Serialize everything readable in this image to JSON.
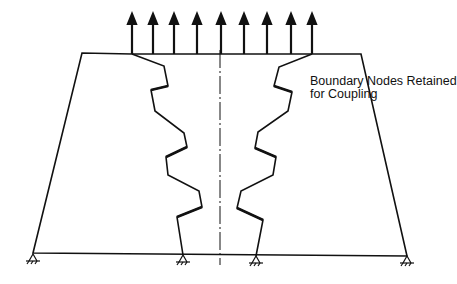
{
  "diagram": {
    "annotation": {
      "line1": "Boundary Nodes Retained",
      "line2": "for Coupling"
    },
    "arrows_x": [
      132,
      153,
      174,
      197,
      221,
      244,
      267,
      291,
      312
    ],
    "outline": {
      "top_left": [
        82,
        53
      ],
      "top_right": [
        361,
        54
      ],
      "bottom_left": [
        33,
        253
      ],
      "bottom_right": [
        407,
        256
      ]
    },
    "left_boundary": [
      [
        132,
        54
      ],
      [
        164,
        66
      ],
      [
        168,
        86
      ],
      [
        151,
        90
      ],
      [
        155,
        111
      ],
      [
        184,
        133
      ],
      [
        187,
        147
      ],
      [
        166,
        157
      ],
      [
        168,
        175
      ],
      [
        199,
        191
      ],
      [
        202,
        207
      ],
      [
        177,
        217
      ],
      [
        183,
        255
      ]
    ],
    "right_boundary": [
      [
        312,
        54
      ],
      [
        279,
        67
      ],
      [
        274,
        86
      ],
      [
        292,
        92
      ],
      [
        288,
        111
      ],
      [
        258,
        132
      ],
      [
        255,
        148
      ],
      [
        276,
        157
      ],
      [
        273,
        175
      ],
      [
        241,
        191
      ],
      [
        237,
        208
      ],
      [
        263,
        220
      ],
      [
        256,
        256
      ]
    ],
    "supports_x": [
      33,
      183,
      256,
      407
    ],
    "centerline_x": 220,
    "color": "#111111"
  }
}
